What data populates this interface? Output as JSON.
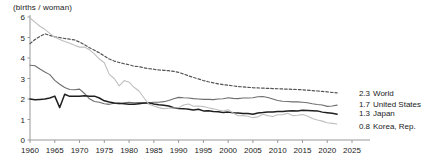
{
  "chart_data": {
    "type": "line",
    "title": "",
    "subtitle": "",
    "ylabel": "(births / woman)",
    "xlabel": "",
    "xlim": [
      1960,
      2025
    ],
    "ylim": [
      0,
      6
    ],
    "yticks": [
      "0",
      "1",
      "2",
      "3",
      "4",
      "5",
      "6"
    ],
    "xticks": [
      "1960",
      "1965",
      "1970",
      "1975",
      "1980",
      "1985",
      "1990",
      "1995",
      "2000",
      "2005",
      "2010",
      "2015",
      "2020",
      "2025"
    ],
    "grid": false,
    "legend_position": "right-inline",
    "x": [
      1960,
      1961,
      1962,
      1963,
      1964,
      1965,
      1966,
      1967,
      1968,
      1969,
      1970,
      1971,
      1972,
      1973,
      1974,
      1975,
      1976,
      1977,
      1978,
      1979,
      1980,
      1981,
      1982,
      1983,
      1984,
      1985,
      1986,
      1987,
      1988,
      1989,
      1990,
      1991,
      1992,
      1993,
      1994,
      1995,
      1996,
      1997,
      1998,
      1999,
      2000,
      2001,
      2002,
      2003,
      2004,
      2005,
      2006,
      2007,
      2008,
      2009,
      2010,
      2011,
      2012,
      2013,
      2014,
      2015,
      2016,
      2017,
      2018,
      2019,
      2020,
      2021,
      2022
    ],
    "series": [
      {
        "name": "World",
        "end_label": "2.3",
        "color": "#555555",
        "style": "dashed",
        "values": [
          4.7,
          4.9,
          5.05,
          5.18,
          5.1,
          5.03,
          5.0,
          4.95,
          4.92,
          4.88,
          4.78,
          4.65,
          4.5,
          4.38,
          4.25,
          4.1,
          3.95,
          3.85,
          3.78,
          3.72,
          3.67,
          3.6,
          3.58,
          3.52,
          3.48,
          3.45,
          3.42,
          3.4,
          3.38,
          3.35,
          3.3,
          3.22,
          3.13,
          3.05,
          2.98,
          2.9,
          2.84,
          2.79,
          2.74,
          2.7,
          2.67,
          2.64,
          2.61,
          2.59,
          2.57,
          2.55,
          2.54,
          2.53,
          2.52,
          2.51,
          2.5,
          2.49,
          2.48,
          2.47,
          2.46,
          2.45,
          2.43,
          2.41,
          2.39,
          2.37,
          2.35,
          2.32,
          2.3
        ]
      },
      {
        "name": "United States",
        "end_label": "1.7",
        "color": "#6e6e6e",
        "style": "solid",
        "values": [
          3.65,
          3.62,
          3.46,
          3.32,
          3.19,
          2.91,
          2.72,
          2.56,
          2.46,
          2.45,
          2.48,
          2.27,
          2.01,
          1.88,
          1.84,
          1.77,
          1.74,
          1.79,
          1.76,
          1.81,
          1.84,
          1.81,
          1.83,
          1.8,
          1.81,
          1.84,
          1.84,
          1.87,
          1.93,
          2.01,
          2.08,
          2.06,
          2.05,
          2.02,
          2.0,
          1.98,
          1.98,
          1.97,
          2.0,
          2.01,
          2.06,
          2.03,
          2.02,
          2.05,
          2.05,
          2.06,
          2.11,
          2.12,
          2.07,
          2.0,
          1.93,
          1.89,
          1.88,
          1.86,
          1.86,
          1.84,
          1.82,
          1.77,
          1.73,
          1.71,
          1.64,
          1.66,
          1.7
        ]
      },
      {
        "name": "Japan",
        "end_label": "1.3",
        "color": "#1f1f1f",
        "style": "solid",
        "values": [
          2.0,
          1.96,
          1.98,
          2.0,
          2.05,
          2.14,
          1.58,
          2.23,
          2.13,
          2.13,
          2.13,
          2.16,
          2.14,
          2.14,
          2.05,
          1.91,
          1.85,
          1.8,
          1.79,
          1.77,
          1.75,
          1.74,
          1.77,
          1.8,
          1.81,
          1.76,
          1.72,
          1.69,
          1.66,
          1.57,
          1.54,
          1.53,
          1.5,
          1.46,
          1.5,
          1.42,
          1.43,
          1.39,
          1.38,
          1.34,
          1.36,
          1.33,
          1.32,
          1.29,
          1.29,
          1.26,
          1.32,
          1.34,
          1.37,
          1.37,
          1.39,
          1.39,
          1.41,
          1.43,
          1.42,
          1.45,
          1.44,
          1.43,
          1.42,
          1.36,
          1.33,
          1.3,
          1.26
        ]
      },
      {
        "name": "Korea, Rep.",
        "end_label": "0.8",
        "color": "#bfbfbf",
        "style": "solid",
        "values": [
          5.95,
          5.75,
          5.55,
          5.4,
          5.2,
          5.02,
          4.9,
          4.8,
          4.72,
          4.62,
          4.53,
          4.54,
          4.4,
          4.2,
          3.95,
          3.77,
          3.2,
          3.0,
          2.64,
          2.9,
          2.82,
          2.57,
          2.39,
          2.06,
          1.74,
          1.66,
          1.58,
          1.53,
          1.55,
          1.56,
          1.57,
          1.71,
          1.76,
          1.65,
          1.66,
          1.63,
          1.57,
          1.52,
          1.46,
          1.41,
          1.48,
          1.31,
          1.18,
          1.19,
          1.16,
          1.09,
          1.13,
          1.26,
          1.19,
          1.15,
          1.23,
          1.24,
          1.3,
          1.19,
          1.21,
          1.24,
          1.17,
          1.05,
          0.98,
          0.92,
          0.84,
          0.81,
          0.78
        ]
      }
    ]
  },
  "plot": {
    "left": 30,
    "right": 352,
    "top": 17,
    "bottom": 140
  }
}
